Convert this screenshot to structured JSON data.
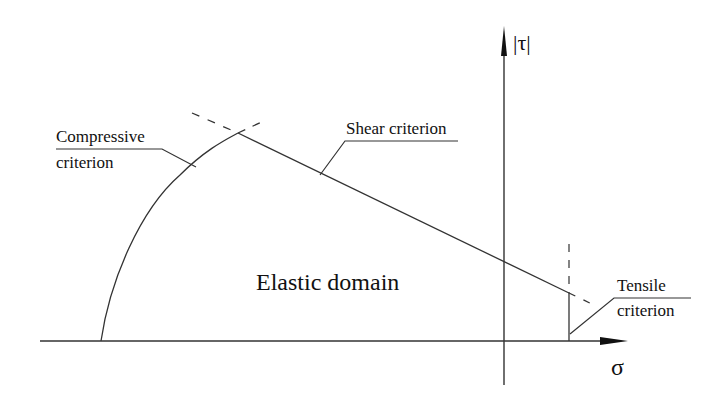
{
  "diagram": {
    "axes": {
      "x_label": "σ",
      "y_label": "|τ|"
    },
    "regions": {
      "elastic_domain": "Elastic domain"
    },
    "criteria": {
      "compressive": {
        "line1": "Compressive",
        "line2": "criterion"
      },
      "shear": {
        "label": "Shear criterion"
      },
      "tensile": {
        "line1": "Tensile",
        "line2": "criterion"
      }
    },
    "colors": {
      "stroke": "#333333",
      "text": "#111111",
      "background": "#ffffff"
    }
  }
}
